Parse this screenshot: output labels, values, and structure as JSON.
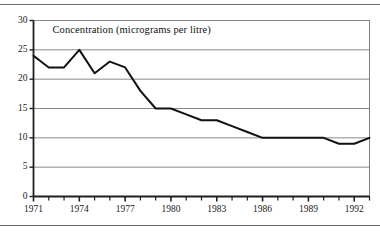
{
  "chart_data": {
    "type": "line",
    "title": "Concentration (micrograms per litre)",
    "xlabel": "",
    "ylabel": "",
    "ylim": [
      0,
      30
    ],
    "ytick_values": [
      0,
      5,
      10,
      15,
      20,
      25,
      30
    ],
    "ytick_labels": [
      "0",
      "5",
      "10",
      "15",
      "20",
      "25",
      "30"
    ],
    "xlim": [
      1971,
      1993
    ],
    "xtick_labels": [
      "1971",
      "1974",
      "1977",
      "1980",
      "1983",
      "1986",
      "1989",
      "1992"
    ],
    "xtick_values": [
      1971,
      1974,
      1977,
      1980,
      1983,
      1986,
      1989,
      1992
    ],
    "minor_xticks_every": 1,
    "grid": "horizontal",
    "legend": "none",
    "line_color": "#111111",
    "x": [
      1971,
      1972,
      1973,
      1974,
      1975,
      1976,
      1977,
      1978,
      1979,
      1980,
      1981,
      1982,
      1983,
      1984,
      1985,
      1986,
      1987,
      1988,
      1989,
      1990,
      1991,
      1992,
      1993
    ],
    "values": [
      24,
      22,
      22,
      25,
      21,
      23,
      22,
      18,
      15,
      15,
      14,
      13,
      13,
      12,
      11,
      10,
      10,
      10,
      10,
      10,
      9,
      9,
      10
    ],
    "series": [
      {
        "name": "Concentration",
        "values": [
          24,
          22,
          22,
          25,
          21,
          23,
          22,
          18,
          15,
          15,
          14,
          13,
          13,
          12,
          11,
          10,
          10,
          10,
          10,
          10,
          9,
          9,
          10
        ]
      }
    ]
  },
  "figure": {
    "title": "Concentration (micrograms per litre)"
  }
}
